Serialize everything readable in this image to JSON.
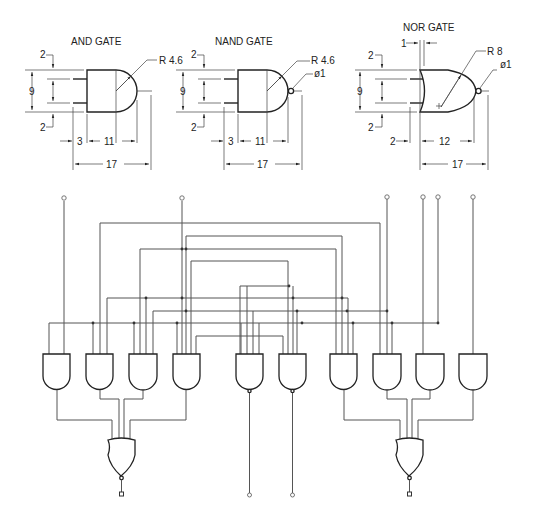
{
  "details": {
    "and_gate": {
      "title": "AND GATE",
      "dims": {
        "top_offset": "2",
        "height": "9",
        "bottom_offset": "2",
        "pin_length": "3",
        "body_length": "11",
        "total_length": "17",
        "radius": "R 4.6"
      }
    },
    "nand_gate": {
      "title": "NAND GATE",
      "dims": {
        "top_offset": "2",
        "height": "9",
        "bottom_offset": "2",
        "pin_length": "3",
        "body_length": "11",
        "total_length": "17",
        "radius": "R 4.6",
        "bubble": "ø1"
      }
    },
    "nor_gate": {
      "title": "NOR GATE",
      "dims": {
        "curve_depth": "1",
        "top_offset": "2",
        "height": "9",
        "bottom_offset": "2",
        "pin_length": "2",
        "body_length": "12",
        "total_length": "17",
        "radius": "R 8",
        "bubble": "ø1"
      }
    }
  },
  "circuit": {
    "input_count": 7,
    "and_gates": 8,
    "nand_gates": 2,
    "nor_gates": 2,
    "outputs": 4
  },
  "colors": {
    "line": "#222222",
    "wire": "#555555",
    "background": "#ffffff"
  }
}
